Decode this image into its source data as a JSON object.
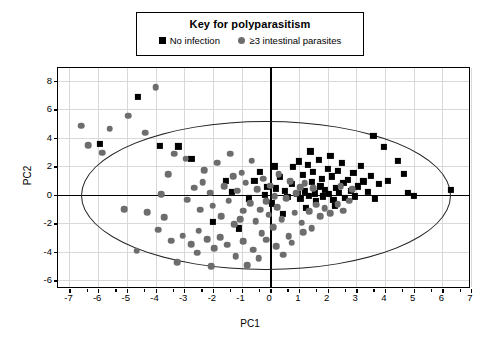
{
  "legend": {
    "title": "Key for polyparasitism",
    "entries": [
      {
        "label": "No infection",
        "marker": "square-marker",
        "color": "#000000"
      },
      {
        "label": "≥3 intestinal parasites",
        "marker": "circle-marker",
        "color": "#6d6d6d"
      }
    ]
  },
  "chart_data": {
    "type": "scatter",
    "title": "",
    "xlabel": "PC1",
    "ylabel": "PC2",
    "xlim": [
      -7.4,
      7.0
    ],
    "ylim": [
      -6.6,
      8.9
    ],
    "xticks": [
      -7,
      -6,
      -5,
      -4,
      -3,
      -2,
      -1,
      0,
      1,
      2,
      3,
      4,
      5,
      6,
      7
    ],
    "yticks": [
      -6,
      -4,
      -2,
      0,
      2,
      4,
      6,
      8
    ],
    "xticklabels": [
      "-7",
      "-6",
      "-5",
      "-4",
      "-3",
      "-2",
      "-1",
      "0",
      "1",
      "2",
      "3",
      "4",
      "5",
      "6",
      "7"
    ],
    "yticklabels": [
      "-6",
      "-4",
      "-2",
      "0",
      "2",
      "4",
      "6",
      "8"
    ],
    "grid": true,
    "legend_position": "top-center-outside",
    "annotations": [
      {
        "type": "ellipse",
        "name": "hotelling-t2-confidence-ellipse",
        "center": [
          -0.15,
          -0.05
        ],
        "semi_axis_x": 6.45,
        "semi_axis_y": 5.25
      }
    ],
    "series": [
      {
        "name": "No infection",
        "marker": "square",
        "color": "#000000",
        "points": [
          [
            -5.95,
            3.6
          ],
          [
            -4.6,
            6.85
          ],
          [
            -3.85,
            3.45
          ],
          [
            -3.2,
            3.4
          ],
          [
            -2.75,
            2.55
          ],
          [
            -1.55,
            1.0
          ],
          [
            -1.35,
            0.2
          ],
          [
            -1.1,
            -2.35
          ],
          [
            -0.75,
            -0.25
          ],
          [
            -0.55,
            1.0
          ],
          [
            -0.35,
            1.6
          ],
          [
            -0.2,
            0.0
          ],
          [
            -0.1,
            0.55
          ],
          [
            0.05,
            -0.6
          ],
          [
            0.2,
            0.45
          ],
          [
            0.35,
            1.25
          ],
          [
            0.5,
            0.3
          ],
          [
            0.6,
            -0.15
          ],
          [
            0.75,
            0.75
          ],
          [
            0.8,
            1.95
          ],
          [
            0.95,
            0.05
          ],
          [
            1.0,
            2.35
          ],
          [
            1.05,
            -0.3
          ],
          [
            1.15,
            1.4
          ],
          [
            1.2,
            0.25
          ],
          [
            1.3,
            2.1
          ],
          [
            1.35,
            -0.05
          ],
          [
            1.45,
            0.9
          ],
          [
            1.5,
            1.6
          ],
          [
            1.55,
            0.1
          ],
          [
            1.6,
            -0.45
          ],
          [
            1.7,
            2.45
          ],
          [
            1.75,
            0.6
          ],
          [
            1.8,
            1.15
          ],
          [
            1.85,
            -0.1
          ],
          [
            1.9,
            0.35
          ],
          [
            2.0,
            1.85
          ],
          [
            2.05,
            0.05
          ],
          [
            2.1,
            2.75
          ],
          [
            2.15,
            1.3
          ],
          [
            2.2,
            -0.35
          ],
          [
            2.3,
            0.5
          ],
          [
            2.35,
            1.7
          ],
          [
            2.4,
            0.15
          ],
          [
            2.5,
            2.25
          ],
          [
            2.55,
            0.85
          ],
          [
            2.6,
            -0.2
          ],
          [
            2.7,
            1.05
          ],
          [
            2.8,
            0.3
          ],
          [
            2.9,
            1.55
          ],
          [
            2.95,
            -0.1
          ],
          [
            3.05,
            0.6
          ],
          [
            3.15,
            2.05
          ],
          [
            3.25,
            0.95
          ],
          [
            3.4,
            0.2
          ],
          [
            3.5,
            1.35
          ],
          [
            3.6,
            4.15
          ],
          [
            3.65,
            -0.3
          ],
          [
            3.8,
            0.75
          ],
          [
            3.95,
            3.35
          ],
          [
            4.1,
            1.0
          ],
          [
            4.45,
            2.4
          ],
          [
            4.65,
            1.45
          ],
          [
            4.8,
            0.15
          ],
          [
            5.0,
            -0.05
          ],
          [
            6.3,
            0.35
          ],
          [
            0.45,
            -1.35
          ],
          [
            1.25,
            -0.9
          ],
          [
            2.25,
            -0.75
          ],
          [
            -2.0,
            -1.9
          ],
          [
            0.15,
            2.0
          ],
          [
            1.4,
            3.05
          ]
        ]
      },
      {
        "name": "≥3 intestinal parasites",
        "marker": "circle",
        "color": "#6d6d6d",
        "points": [
          [
            -6.6,
            4.85
          ],
          [
            -6.35,
            3.5
          ],
          [
            -5.6,
            4.65
          ],
          [
            -5.85,
            2.95
          ],
          [
            -4.95,
            5.55
          ],
          [
            -4.0,
            7.55
          ],
          [
            -4.35,
            4.35
          ],
          [
            -3.55,
            1.45
          ],
          [
            -3.35,
            2.9
          ],
          [
            -2.95,
            2.55
          ],
          [
            -2.65,
            0.5
          ],
          [
            -2.9,
            -0.35
          ],
          [
            -2.45,
            -1.05
          ],
          [
            -2.3,
            1.75
          ],
          [
            -2.1,
            0.15
          ],
          [
            -2.5,
            -2.5
          ],
          [
            -2.0,
            -0.75
          ],
          [
            -1.85,
            2.25
          ],
          [
            -1.7,
            -1.5
          ],
          [
            -1.6,
            0.6
          ],
          [
            -1.45,
            -0.4
          ],
          [
            -1.3,
            1.3
          ],
          [
            -1.25,
            -2.05
          ],
          [
            -1.15,
            0.3
          ],
          [
            -1.0,
            1.55
          ],
          [
            -0.95,
            -1.1
          ],
          [
            -0.85,
            0.85
          ],
          [
            -0.7,
            -0.6
          ],
          [
            -0.65,
            2.4
          ],
          [
            -0.5,
            -1.85
          ],
          [
            -0.45,
            0.4
          ],
          [
            -0.3,
            -2.7
          ],
          [
            -0.25,
            1.15
          ],
          [
            -0.15,
            -0.45
          ],
          [
            -0.05,
            -1.4
          ],
          [
            0.0,
            0.65
          ],
          [
            0.1,
            -2.25
          ],
          [
            0.25,
            -0.85
          ],
          [
            0.3,
            1.45
          ],
          [
            0.4,
            -1.7
          ],
          [
            0.55,
            -0.25
          ],
          [
            0.65,
            -2.9
          ],
          [
            0.7,
            0.95
          ],
          [
            0.85,
            -1.25
          ],
          [
            0.9,
            0.1
          ],
          [
            1.1,
            -1.95
          ],
          [
            1.35,
            -1.15
          ],
          [
            1.6,
            -0.7
          ],
          [
            1.75,
            -1.5
          ],
          [
            1.9,
            -0.95
          ],
          [
            2.1,
            -1.3
          ],
          [
            2.35,
            -0.65
          ],
          [
            2.55,
            -1.1
          ],
          [
            2.75,
            -0.4
          ],
          [
            1.5,
            0.45
          ],
          [
            1.2,
            0.8
          ],
          [
            1.05,
            0.55
          ],
          [
            2.45,
            0.6
          ],
          [
            2.85,
            0.4
          ],
          [
            -3.8,
            0.05
          ],
          [
            -4.3,
            -1.2
          ],
          [
            -3.9,
            -2.45
          ],
          [
            -3.45,
            -3.2
          ],
          [
            -3.05,
            -2.85
          ],
          [
            -2.75,
            -3.45
          ],
          [
            -2.55,
            -4.05
          ],
          [
            -2.2,
            -3.1
          ],
          [
            -1.95,
            -3.75
          ],
          [
            -1.75,
            -2.95
          ],
          [
            -1.5,
            -3.5
          ],
          [
            -1.2,
            -4.3
          ],
          [
            -0.95,
            -3.25
          ],
          [
            -0.6,
            -3.85
          ],
          [
            -0.4,
            -4.45
          ],
          [
            -0.15,
            -3.15
          ],
          [
            0.2,
            -3.6
          ],
          [
            0.45,
            -4.2
          ],
          [
            0.75,
            -3.35
          ],
          [
            1.15,
            -2.6
          ],
          [
            -5.1,
            -1.0
          ],
          [
            -4.65,
            -3.9
          ],
          [
            -3.25,
            -4.7
          ],
          [
            -2.05,
            -5.0
          ],
          [
            -1.05,
            -1.7
          ],
          [
            -0.35,
            -1.05
          ],
          [
            0.15,
            -0.1
          ],
          [
            -2.35,
            0.9
          ],
          [
            -1.4,
            2.9
          ],
          [
            -0.8,
            -4.95
          ],
          [
            1.45,
            -2.35
          ],
          [
            -3.7,
            -1.55
          ]
        ]
      }
    ]
  }
}
